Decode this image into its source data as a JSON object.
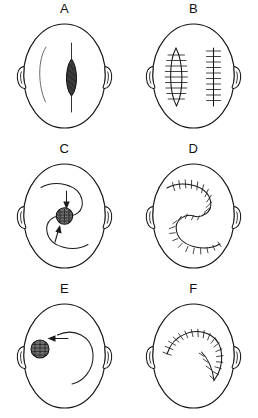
{
  "figure": {
    "layout": {
      "columns": 2,
      "rows": 3
    },
    "view": "head, superior (top-down) view with both ears visible",
    "line_color": "#151515",
    "lesion_fill": "#3b3b3b",
    "background": "#ffffff"
  },
  "panels": [
    {
      "label": "A",
      "caption": "Elliptical (fusiform) lesion excision marked on right scalp with planned incision extensions and faint left-side arc",
      "lesion": {
        "shape": "ellipse",
        "position": "right-of-midline",
        "shaded": true
      },
      "markings": [
        "vertical extension lines above and below lesion",
        "faint curved arc on left scalp"
      ],
      "sutured": false
    },
    {
      "label": "B",
      "caption": "Closed wounds: lens-shaped sutured defect on left and straight sutured line on right",
      "lesion": null,
      "markings": [
        "lens-shaped suture line",
        "straight vertical suture line"
      ],
      "sutured": true
    },
    {
      "label": "C",
      "caption": "Central circular lesion with double opposing rotation (S-plasty / yin-yang) flap design and direction arrows",
      "lesion": {
        "shape": "circle",
        "position": "center",
        "shaded": true
      },
      "markings": [
        "upper rotation arc with downward arrow",
        "lower rotation arc with upward arrow"
      ],
      "sutured": false
    },
    {
      "label": "D",
      "caption": "Completed double rotation flap closure, S-shaped suture line",
      "lesion": null,
      "markings": [
        "S-shaped suture line spanning the scalp"
      ],
      "sutured": true
    },
    {
      "label": "E",
      "caption": "Circular lesion on upper-left scalp with single large rotation flap arc and arrow indicating advancement",
      "lesion": {
        "shape": "circle",
        "position": "upper-left",
        "shaded": true
      },
      "markings": [
        "large C-shaped rotation arc",
        "leftward arrow into lesion"
      ],
      "sutured": false
    },
    {
      "label": "F",
      "caption": "Completed single rotation flap closure, crescent-shaped suture line",
      "lesion": null,
      "markings": [
        "crescent (C-shaped) suture line opening to the left"
      ],
      "sutured": true
    }
  ]
}
